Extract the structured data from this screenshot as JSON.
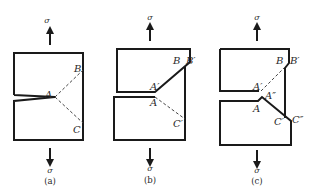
{
  "figure": {
    "stress_symbol": "σ",
    "panels": [
      {
        "id": "a",
        "caption": "(a)",
        "points": {
          "A": "A",
          "B": "B",
          "C": "C"
        }
      },
      {
        "id": "b",
        "caption": "(b)",
        "points": {
          "A": "A",
          "A_prime": "A′",
          "B": "B",
          "B_prime": "B′",
          "C_prime": "C′"
        }
      },
      {
        "id": "c",
        "caption": "(c)",
        "points": {
          "A": "A",
          "A_prime": "A′",
          "A_dprime": "A″",
          "B": "B",
          "B_prime": "B′",
          "C_prime": "C′",
          "C_dprime": "C″"
        }
      }
    ]
  }
}
